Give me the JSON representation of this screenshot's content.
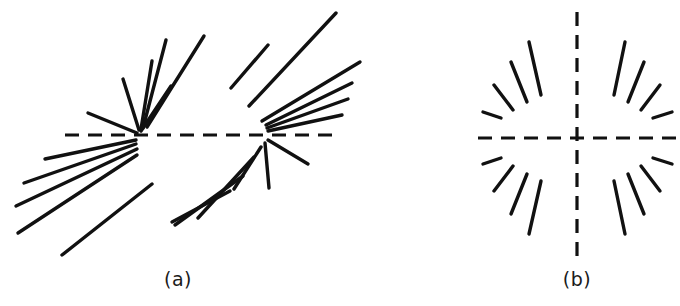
{
  "figure": {
    "background_color": "#ffffff",
    "stroke_color": "#111111",
    "width": 680,
    "height": 306,
    "panels": [
      {
        "id": "panel-a",
        "caption": "(a)",
        "caption_x": 178,
        "caption_y": 282,
        "description": "Two opposing fans of straight line segments converging toward two points on a horizontal dashed axis",
        "axis": {
          "type": "dashed-horizontal",
          "x1": 65,
          "y1": 135,
          "x2": 332,
          "y2": 135,
          "dash": "14 9"
        },
        "vertices": [
          {
            "name": "left-vertex",
            "x": 136,
            "y": 135
          },
          {
            "name": "right-vertex",
            "x": 266,
            "y": 135
          }
        ],
        "rays": [
          {
            "x1": 137,
            "y1": 133,
            "x2": 88,
            "y2": 113
          },
          {
            "x1": 139,
            "y1": 130,
            "x2": 123,
            "y2": 79
          },
          {
            "x1": 141,
            "y1": 129,
            "x2": 152,
            "y2": 61
          },
          {
            "x1": 143,
            "y1": 128,
            "x2": 166,
            "y2": 40
          },
          {
            "x1": 147,
            "y1": 127,
            "x2": 204,
            "y2": 36
          },
          {
            "x1": 141,
            "y1": 131,
            "x2": 171,
            "y2": 86
          },
          {
            "x1": 136,
            "y1": 140,
            "x2": 45,
            "y2": 159
          },
          {
            "x1": 136,
            "y1": 144,
            "x2": 24,
            "y2": 183
          },
          {
            "x1": 137,
            "y1": 149,
            "x2": 16,
            "y2": 206
          },
          {
            "x1": 137,
            "y1": 155,
            "x2": 18,
            "y2": 233
          },
          {
            "x1": 152,
            "y1": 184,
            "x2": 62,
            "y2": 255
          },
          {
            "x1": 268,
            "y1": 131,
            "x2": 342,
            "y2": 115
          },
          {
            "x1": 267,
            "y1": 128,
            "x2": 348,
            "y2": 99
          },
          {
            "x1": 266,
            "y1": 125,
            "x2": 352,
            "y2": 83
          },
          {
            "x1": 262,
            "y1": 121,
            "x2": 360,
            "y2": 62
          },
          {
            "x1": 249,
            "y1": 106,
            "x2": 336,
            "y2": 13
          },
          {
            "x1": 231,
            "y1": 88,
            "x2": 268,
            "y2": 45
          },
          {
            "x1": 268,
            "y1": 140,
            "x2": 308,
            "y2": 164
          },
          {
            "x1": 265,
            "y1": 143,
            "x2": 269,
            "y2": 188
          },
          {
            "x1": 261,
            "y1": 147,
            "x2": 234,
            "y2": 189
          },
          {
            "x1": 254,
            "y1": 157,
            "x2": 198,
            "y2": 218
          },
          {
            "x1": 243,
            "y1": 176,
            "x2": 175,
            "y2": 225
          },
          {
            "x1": 230,
            "y1": 191,
            "x2": 172,
            "y2": 222
          }
        ]
      },
      {
        "id": "panel-b",
        "caption": "(b)",
        "caption_x": 577,
        "caption_y": 282,
        "description": "Symmetric radial burst of sixteen line segments around a dashed cross",
        "axis_horizontal": {
          "type": "dashed-horizontal",
          "x1": 478,
          "y1": 138,
          "x2": 676,
          "y2": 138,
          "dash": "14 9"
        },
        "axis_vertical": {
          "type": "dashed-vertical",
          "x1": 577,
          "y1": 12,
          "x2": 577,
          "y2": 258,
          "dash": "14 9"
        },
        "center": {
          "x": 577,
          "y": 138
        },
        "rays": [
          {
            "x1": 501,
            "y1": 118,
            "x2": 483,
            "y2": 112
          },
          {
            "x1": 513,
            "y1": 110,
            "x2": 494,
            "y2": 85
          },
          {
            "x1": 527,
            "y1": 102,
            "x2": 511,
            "y2": 62
          },
          {
            "x1": 541,
            "y1": 95,
            "x2": 529,
            "y2": 42
          },
          {
            "x1": 614,
            "y1": 95,
            "x2": 625,
            "y2": 42
          },
          {
            "x1": 628,
            "y1": 102,
            "x2": 644,
            "y2": 62
          },
          {
            "x1": 641,
            "y1": 110,
            "x2": 660,
            "y2": 85
          },
          {
            "x1": 653,
            "y1": 118,
            "x2": 672,
            "y2": 112
          },
          {
            "x1": 501,
            "y1": 158,
            "x2": 483,
            "y2": 164
          },
          {
            "x1": 513,
            "y1": 166,
            "x2": 494,
            "y2": 191
          },
          {
            "x1": 527,
            "y1": 174,
            "x2": 511,
            "y2": 214
          },
          {
            "x1": 541,
            "y1": 181,
            "x2": 529,
            "y2": 234
          },
          {
            "x1": 614,
            "y1": 181,
            "x2": 625,
            "y2": 234
          },
          {
            "x1": 628,
            "y1": 174,
            "x2": 644,
            "y2": 214
          },
          {
            "x1": 641,
            "y1": 166,
            "x2": 660,
            "y2": 191
          },
          {
            "x1": 653,
            "y1": 158,
            "x2": 672,
            "y2": 164
          }
        ]
      }
    ]
  }
}
